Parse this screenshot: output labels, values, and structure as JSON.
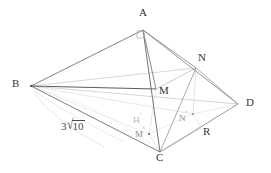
{
  "figure": {
    "stroke_dark": "#4a4a4a",
    "stroke_mid": "#8a8a8a",
    "stroke_light": "#c3c3c3",
    "stroke_faint": "#dcdcdc",
    "background": "#ffffff"
  },
  "vertices": [
    {
      "id": "A",
      "label": "A",
      "x": 143,
      "y": 30,
      "label_x": 139,
      "label_y": 12,
      "kind": "apex"
    },
    {
      "id": "B",
      "label": "B",
      "x": 31,
      "y": 86,
      "label_x": 13,
      "label_y": 79,
      "kind": "base"
    },
    {
      "id": "C",
      "label": "C",
      "x": 160,
      "y": 152,
      "label_x": 155,
      "label_y": 153,
      "kind": "base"
    },
    {
      "id": "D",
      "label": "D",
      "x": 238,
      "y": 104,
      "label_x": 245,
      "label_y": 97,
      "kind": "base"
    },
    {
      "id": "M",
      "label": "M",
      "x": 156,
      "y": 89,
      "label_x": 158,
      "label_y": 85,
      "kind": "point"
    },
    {
      "id": "N",
      "label": "N",
      "x": 196,
      "y": 68,
      "label_x": 198,
      "label_y": 53,
      "kind": "point"
    },
    {
      "id": "R",
      "label": "R",
      "x": 201,
      "y": 128,
      "label_x": 203,
      "label_y": 127,
      "kind": "point"
    }
  ],
  "projections": [
    {
      "id": "Hp",
      "label": "H",
      "prime": "′",
      "x": 139,
      "y": 122,
      "label_x": 133,
      "label_y": 113,
      "style": "faint"
    },
    {
      "id": "Mp",
      "label": "M",
      "prime": "′",
      "x": 149,
      "y": 134,
      "label_x": 136,
      "label_y": 128,
      "style": "proj"
    },
    {
      "id": "Np",
      "label": "N",
      "prime": "′",
      "x": 193,
      "y": 114,
      "label_x": 180,
      "label_y": 112,
      "style": "proj"
    }
  ],
  "measurements": [
    {
      "id": "BC-length",
      "coefficient": "3",
      "radical": "√",
      "radicand": "10",
      "text": "3√10",
      "label_x": 62,
      "label_y": 126
    }
  ],
  "markers": [
    {
      "id": "right-angle-A",
      "label": "right-angle-marker",
      "x": 140,
      "y": 34
    }
  ],
  "edges": [
    {
      "id": "B-A",
      "from": "B",
      "to": "A",
      "weight": "solid-dark"
    },
    {
      "id": "A-D",
      "from": "A",
      "to": "D",
      "weight": "solid-mid"
    },
    {
      "id": "B-C",
      "from": "B",
      "to": "C",
      "weight": "solid-dark"
    },
    {
      "id": "C-D",
      "from": "C",
      "to": "D",
      "weight": "solid-mid"
    },
    {
      "id": "A-C",
      "from": "A",
      "to": "C",
      "weight": "solid-dark"
    },
    {
      "id": "A-N",
      "from": "A",
      "to": "N",
      "weight": "solid-mid"
    },
    {
      "id": "N-C",
      "from": "N",
      "to": "C",
      "weight": "solid-mid"
    },
    {
      "id": "N-D",
      "from": "N",
      "to": "D",
      "weight": "solid-mid"
    },
    {
      "id": "B-M",
      "from": "B",
      "to": "M",
      "weight": "solid-dark"
    },
    {
      "id": "B-N",
      "from": "B",
      "to": "N",
      "weight": "light"
    },
    {
      "id": "B-D",
      "from": "B",
      "to": "D",
      "weight": "light"
    },
    {
      "id": "B-Np",
      "from": "B",
      "to": "Np",
      "weight": "faint"
    },
    {
      "id": "B-Mp",
      "from": "B",
      "to": "Mp",
      "weight": "faint"
    },
    {
      "id": "A-M",
      "from": "A",
      "to": "M",
      "weight": "solid-dark"
    },
    {
      "id": "M-N",
      "from": "M",
      "to": "N",
      "weight": "light"
    },
    {
      "id": "M-Mp",
      "from": "M",
      "to": "Mp",
      "weight": "faint"
    },
    {
      "id": "N-Np",
      "from": "N",
      "to": "Np",
      "weight": "faint"
    },
    {
      "id": "Mp-C",
      "from": "Mp",
      "to": "C",
      "weight": "faint"
    },
    {
      "id": "Np-R",
      "from": "Np",
      "to": "R",
      "weight": "faint"
    },
    {
      "id": "Mp-Np",
      "from": "Mp",
      "to": "Np",
      "weight": "faint"
    }
  ],
  "arcs": [
    {
      "id": "arc-B-lower",
      "d": "M 33 92 Q 55 122 104 147",
      "style": "faint"
    },
    {
      "id": "arc-B-inner",
      "d": "M 33 90 Q 62 112 122 141",
      "style": "faint"
    }
  ]
}
